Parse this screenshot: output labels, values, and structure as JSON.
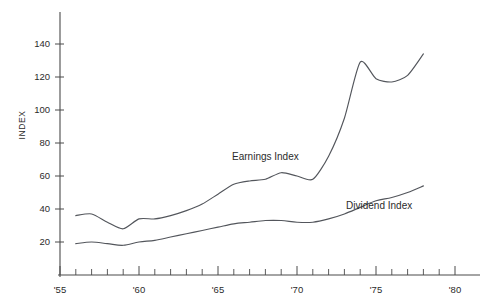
{
  "chart_data": {
    "type": "line",
    "title": "",
    "subtitle": "",
    "xlabel": "",
    "ylabel": "INDEX",
    "xlim": [
      1955,
      1980
    ],
    "ylim": [
      0,
      150
    ],
    "yticks": [
      20,
      40,
      60,
      80,
      100,
      120,
      140
    ],
    "ytick_labels": [
      "20",
      "40",
      "60",
      "80",
      "100",
      "120",
      "140"
    ],
    "xticks": [
      1955,
      1960,
      1965,
      1970,
      1975,
      1980
    ],
    "xtick_labels": [
      "'55",
      "'60",
      "'65",
      "'70",
      "'75",
      "'80"
    ],
    "minor_xticks_every": 1,
    "grid": false,
    "legend": "inline-annotations",
    "series": [
      {
        "name": "Earnings Index",
        "label_position": {
          "x": 1968.0,
          "y": 70
        },
        "x": [
          1956,
          1957,
          1958,
          1959,
          1960,
          1961,
          1962,
          1963,
          1964,
          1965,
          1966,
          1967,
          1968,
          1969,
          1970,
          1971,
          1972,
          1973,
          1974,
          1975,
          1976,
          1977,
          1978
        ],
        "values": [
          36,
          37,
          32,
          28,
          34,
          34,
          36,
          39,
          43,
          49,
          55,
          57,
          58,
          62,
          60,
          58,
          72,
          95,
          129,
          119,
          117,
          121,
          134
        ]
      },
      {
        "name": "Dividend Index",
        "label_position": {
          "x": 1975.2,
          "y": 40
        },
        "x": [
          1956,
          1957,
          1958,
          1959,
          1960,
          1961,
          1962,
          1963,
          1964,
          1965,
          1966,
          1967,
          1968,
          1969,
          1970,
          1971,
          1972,
          1973,
          1974,
          1975,
          1976,
          1977,
          1978
        ],
        "values": [
          19,
          20,
          19,
          18,
          20,
          21,
          23,
          25,
          27,
          29,
          31,
          32,
          33,
          33,
          32,
          32,
          34,
          37,
          41,
          45,
          47,
          50,
          54
        ]
      }
    ],
    "colors": {
      "line": "#53565c",
      "axis": "#4a4a4a",
      "text": "#2b2b2b",
      "background": "#ffffff"
    }
  },
  "layout": {
    "plot_left_px": 60,
    "plot_right_px": 455,
    "plot_baseline_px": 275,
    "plot_top_px": 12,
    "px_per_year": 15.8,
    "y_20_px": 242,
    "y_140_px": 44
  }
}
